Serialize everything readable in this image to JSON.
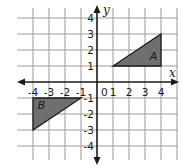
{
  "chart_data": {
    "type": "scatter",
    "title": "",
    "xlabel": "x",
    "ylabel": "y",
    "xlim": [
      -4,
      4
    ],
    "ylim": [
      -4,
      4
    ],
    "grid": true,
    "origin_label": "0",
    "x_ticks": [
      {
        "value": -4,
        "label": "-4"
      },
      {
        "value": -3,
        "label": "-3"
      },
      {
        "value": -2,
        "label": "-2"
      },
      {
        "value": -1,
        "label": "-1"
      },
      {
        "value": 1,
        "label": "1"
      },
      {
        "value": 2,
        "label": "2"
      },
      {
        "value": 3,
        "label": "3"
      },
      {
        "value": 4,
        "label": "4"
      }
    ],
    "y_ticks": [
      {
        "value": 4,
        "label": "4"
      },
      {
        "value": 3,
        "label": "3"
      },
      {
        "value": 2,
        "label": "2"
      },
      {
        "value": 1,
        "label": "1"
      },
      {
        "value": -1,
        "label": "-1"
      },
      {
        "value": -2,
        "label": "-2"
      },
      {
        "value": -3,
        "label": "-3"
      },
      {
        "value": -4,
        "label": "-4"
      }
    ],
    "shapes": [
      {
        "name": "A",
        "vertices": [
          [
            1,
            1
          ],
          [
            4,
            1
          ],
          [
            4,
            3
          ]
        ],
        "label_at": [
          3.3,
          1.4
        ],
        "fill": "#6f6f6f"
      },
      {
        "name": "B",
        "vertices": [
          [
            -4,
            -1
          ],
          [
            -1,
            -1
          ],
          [
            -4,
            -3
          ]
        ],
        "label_at": [
          -3.7,
          -1.7
        ],
        "fill": "#6f6f6f"
      }
    ]
  }
}
